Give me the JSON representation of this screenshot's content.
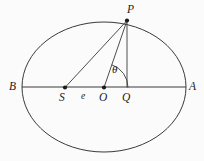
{
  "figure": {
    "width": 204,
    "height": 161,
    "background_color": "#fbfbfb",
    "stroke_color": "#3a3a3a",
    "label_color": "#1a1a1a"
  },
  "labels": {
    "vertex_left": "B",
    "vertex_right": "A",
    "focus": "S",
    "center": "O",
    "foot": "Q",
    "point_on_ellipse": "P",
    "eccentricity": "e",
    "angle": "θ"
  },
  "geometry": {
    "ellipse": {
      "cx": 104,
      "cy": 87,
      "rx": 82,
      "ry": 65
    },
    "points": {
      "A": {
        "x": 186,
        "y": 87
      },
      "B": {
        "x": 22,
        "y": 87
      },
      "O": {
        "x": 104,
        "y": 87.5
      },
      "S": {
        "x": 65,
        "y": 87.5
      },
      "Q": {
        "x": 127,
        "y": 87.5
      },
      "P": {
        "x": 127,
        "y": 20.5
      }
    },
    "segments": [
      {
        "name": "major-axis",
        "from": "B",
        "to": "A"
      },
      {
        "name": "focal-radius",
        "from": "S",
        "to": "P"
      },
      {
        "name": "center-radius",
        "from": "O",
        "to": "P"
      },
      {
        "name": "ordinate",
        "from": "P",
        "to": "Q"
      }
    ],
    "angle_arc": {
      "vertex": "O",
      "radius": 24,
      "start_deg": 0,
      "end_deg": 71
    },
    "dots": [
      "S",
      "O",
      "P"
    ]
  },
  "label_positions": {
    "B": {
      "x": 9,
      "y": 81
    },
    "A": {
      "x": 189,
      "y": 81
    },
    "S": {
      "x": 59,
      "y": 92
    },
    "e": {
      "x": 81,
      "y": 92
    },
    "O": {
      "x": 99,
      "y": 92
    },
    "Q": {
      "x": 122,
      "y": 92
    },
    "P": {
      "x": 127,
      "y": 4
    },
    "theta": {
      "x": 112,
      "y": 64
    }
  }
}
